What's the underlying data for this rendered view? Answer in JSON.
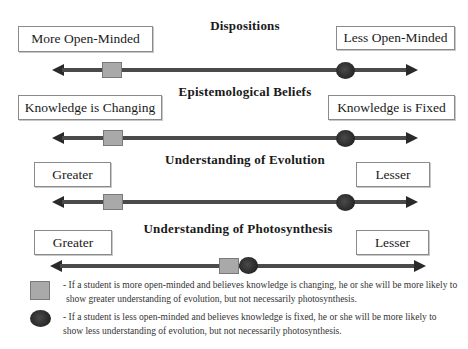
{
  "rows": [
    {
      "title": "Dispositions",
      "left_label": "More Open-Minded",
      "right_label": "Less Open-Minded",
      "square_position_x": 102,
      "circle_position_x": 336
    },
    {
      "title": "Epistemological Beliefs",
      "left_label": "Knowledge is Changing",
      "right_label": "Knowledge is Fixed",
      "square_position_x": 103,
      "circle_position_x": 336
    },
    {
      "title": "Understanding of Evolution",
      "left_label": "Greater",
      "right_label": "Lesser",
      "square_position_x": 103,
      "circle_position_x": 336
    },
    {
      "title": "Understanding of Photosynthesis",
      "left_label": "Greater",
      "right_label": "Lesser",
      "square_position_x": 219,
      "circle_position_x": 239
    }
  ],
  "legend": {
    "square": {
      "marker": "gray-square",
      "color": "#a9a9a9",
      "line1": "- If a student is more open-minded and believes knowledge is changing, he or she will be more likely to",
      "line2": "show greater understanding of evolution, but not necessarily photosynthesis."
    },
    "circle": {
      "marker": "dark-circle",
      "color": "#262626",
      "line1": "- If a student is less open-minded and believes knowledge is fixed, he or she will be more likely to",
      "line2": "show less understanding of evolution, but not necessarily photosynthesis."
    }
  }
}
